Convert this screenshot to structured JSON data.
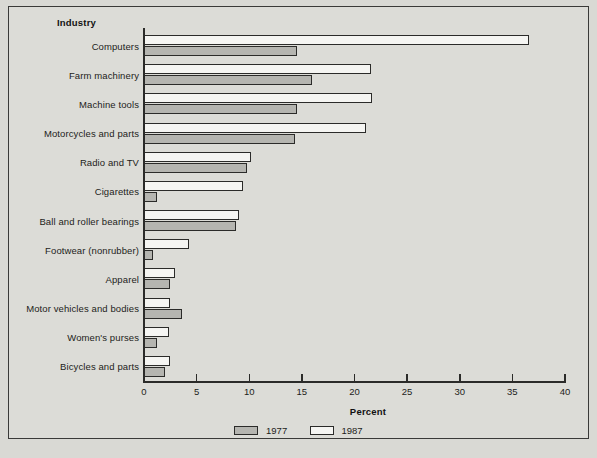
{
  "chart_data": {
    "type": "bar",
    "orientation": "horizontal",
    "title": "",
    "xlabel": "Percent",
    "ylabel": "Industry",
    "xlim": [
      0,
      40
    ],
    "xticks": [
      0,
      5,
      10,
      15,
      20,
      25,
      30,
      35,
      40
    ],
    "grid": false,
    "legend_position": "bottom-center",
    "categories": [
      "Computers",
      "Farm machinery",
      "Machine tools",
      "Motorcycles and parts",
      "Radio and TV",
      "Cigarettes",
      "Ball and roller bearings",
      "Footwear (nonrubber)",
      "Apparel",
      "Motor vehicles and bodies",
      "Women's purses",
      "Bicycles and parts"
    ],
    "series": [
      {
        "name": "1977",
        "color": "#b5b5b0",
        "values": [
          14.5,
          16.0,
          14.5,
          14.3,
          9.8,
          1.2,
          8.7,
          0.9,
          2.5,
          3.6,
          1.2,
          2.0
        ]
      },
      {
        "name": "1987",
        "color": "#f5f5f2",
        "values": [
          36.6,
          21.6,
          21.7,
          21.1,
          10.2,
          9.4,
          9.0,
          4.3,
          2.9,
          2.5,
          2.4,
          2.5
        ]
      }
    ]
  },
  "header": {
    "industry_label": "Industry"
  },
  "axis": {
    "x_title": "Percent",
    "tick_labels": [
      "0",
      "5",
      "10",
      "15",
      "20",
      "25",
      "30",
      "35",
      "40"
    ]
  },
  "legend": {
    "items": [
      {
        "label": "1977",
        "swatch": "gray-swatch"
      },
      {
        "label": "1987",
        "swatch": "white-swatch"
      }
    ]
  },
  "footer": {
    "source": ""
  },
  "colors": {
    "background": "#dcdcd7",
    "frame": "#3a3a38",
    "axis": "#2b2b29",
    "bar_1977": "#b5b5b0",
    "bar_1987": "#f5f5f2",
    "text": "#1c1c1a"
  }
}
